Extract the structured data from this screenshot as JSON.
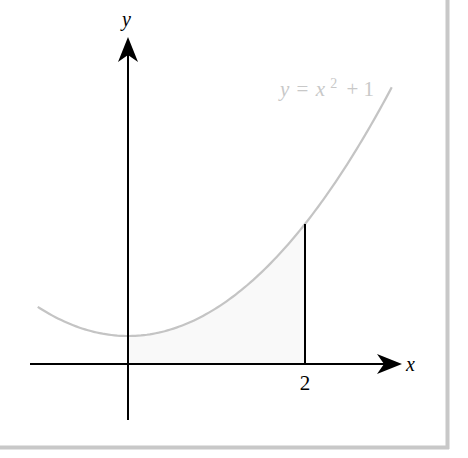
{
  "figure": {
    "axis_labels": {
      "x": "x",
      "y": "y"
    },
    "tick_labels": [
      {
        "value": 2,
        "text": "2"
      }
    ],
    "curve_label": {
      "lhs": "y",
      "eq": "=",
      "base": "x",
      "exp": "2",
      "rest": "+ 1"
    },
    "colors": {
      "axes": "#000000",
      "curve": "#c4c4c4",
      "curve_label": "#c8c8c8",
      "shade": "#f9f9f9",
      "border": "#c8c8c8",
      "background": "#ffffff"
    }
  },
  "chart_data": {
    "type": "line",
    "title": "",
    "xlabel": "x",
    "ylabel": "y",
    "function": "y = x^2 + 1",
    "x_domain": [
      -1.02,
      2.98
    ],
    "shaded_region": {
      "from_x": 0,
      "to_x": 2,
      "under": "y = x^2 + 1"
    },
    "marked_points": [
      {
        "x": 2,
        "y": 5,
        "vertical_line": true
      }
    ],
    "vertex": {
      "x": 0,
      "y": 1
    },
    "xticks": [
      2
    ],
    "grid": false
  }
}
